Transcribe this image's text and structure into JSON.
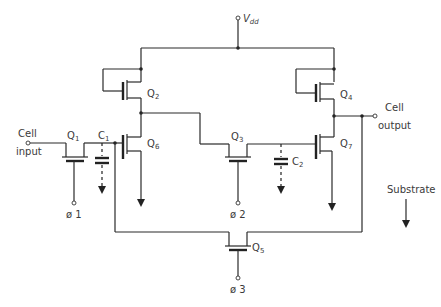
{
  "diagram": {
    "supply": {
      "label": "V",
      "sub": "dd"
    },
    "terminals": {
      "input": {
        "line1": "Cell",
        "line2": "input"
      },
      "output": {
        "line1": "Cell",
        "line2": "output"
      },
      "phi1": "ø 1",
      "phi2": "ø 2",
      "phi3": "ø 3"
    },
    "transistors": [
      {
        "id": "Q1",
        "letter": "Q",
        "sub": "1"
      },
      {
        "id": "Q2",
        "letter": "Q",
        "sub": "2"
      },
      {
        "id": "Q3",
        "letter": "Q",
        "sub": "3"
      },
      {
        "id": "Q4",
        "letter": "Q",
        "sub": "4"
      },
      {
        "id": "Q5",
        "letter": "Q",
        "sub": "5"
      },
      {
        "id": "Q6",
        "letter": "Q",
        "sub": "6"
      },
      {
        "id": "Q7",
        "letter": "Q",
        "sub": "7"
      }
    ],
    "capacitors": [
      {
        "id": "C1",
        "letter": "C",
        "sub": "1"
      },
      {
        "id": "C2",
        "letter": "C",
        "sub": "2"
      }
    ],
    "substrate_label": "Substrate"
  }
}
